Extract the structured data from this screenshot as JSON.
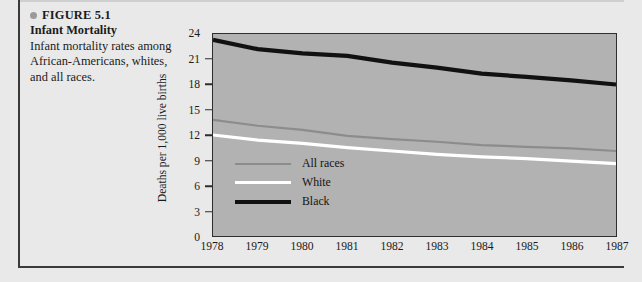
{
  "figure": {
    "bullet_icon": "bullet-dot-icon",
    "number_label": "FIGURE 5.1",
    "title": "Infant Mortality",
    "description": "Infant mortality rates among African-Americans, whites, and all races."
  },
  "colors": {
    "page_background": "#e9e9e9",
    "plot_background": "#b2b2b2",
    "frame": "#2e2e2e",
    "all_races_line": "#8c8c8c",
    "white_line": "#ffffff",
    "black_line": "#111111"
  },
  "chart_data": {
    "type": "line",
    "title": "Infant Mortality",
    "xlabel": "",
    "ylabel": "Deaths per 1,000 live births",
    "categories": [
      "1978",
      "1979",
      "1980",
      "1981",
      "1982",
      "1983",
      "1984",
      "1985",
      "1986",
      "1987"
    ],
    "x": [
      1978,
      1979,
      1980,
      1981,
      1982,
      1983,
      1984,
      1985,
      1986,
      1987
    ],
    "xlim": [
      1978,
      1987
    ],
    "ylim": [
      0,
      24
    ],
    "yticks": [
      0,
      3,
      6,
      9,
      12,
      15,
      18,
      21,
      24
    ],
    "grid": false,
    "legend_position": "inside-lower-left",
    "series": [
      {
        "name": "All races",
        "color": "#8c8c8c",
        "values": [
          13.8,
          13.1,
          12.6,
          11.9,
          11.5,
          11.2,
          10.8,
          10.6,
          10.4,
          10.1
        ]
      },
      {
        "name": "White",
        "color": "#ffffff",
        "values": [
          12.0,
          11.4,
          11.0,
          10.5,
          10.1,
          9.7,
          9.4,
          9.2,
          8.9,
          8.6
        ]
      },
      {
        "name": "Black",
        "color": "#111111",
        "values": [
          23.3,
          22.2,
          21.7,
          21.4,
          20.6,
          20.0,
          19.3,
          18.9,
          18.5,
          18.0
        ]
      }
    ]
  },
  "legend": [
    {
      "label": "All races",
      "color": "#8c8c8c",
      "thickness": 2
    },
    {
      "label": "White",
      "color": "#ffffff",
      "thickness": 3
    },
    {
      "label": "Black",
      "color": "#111111",
      "thickness": 4
    }
  ]
}
